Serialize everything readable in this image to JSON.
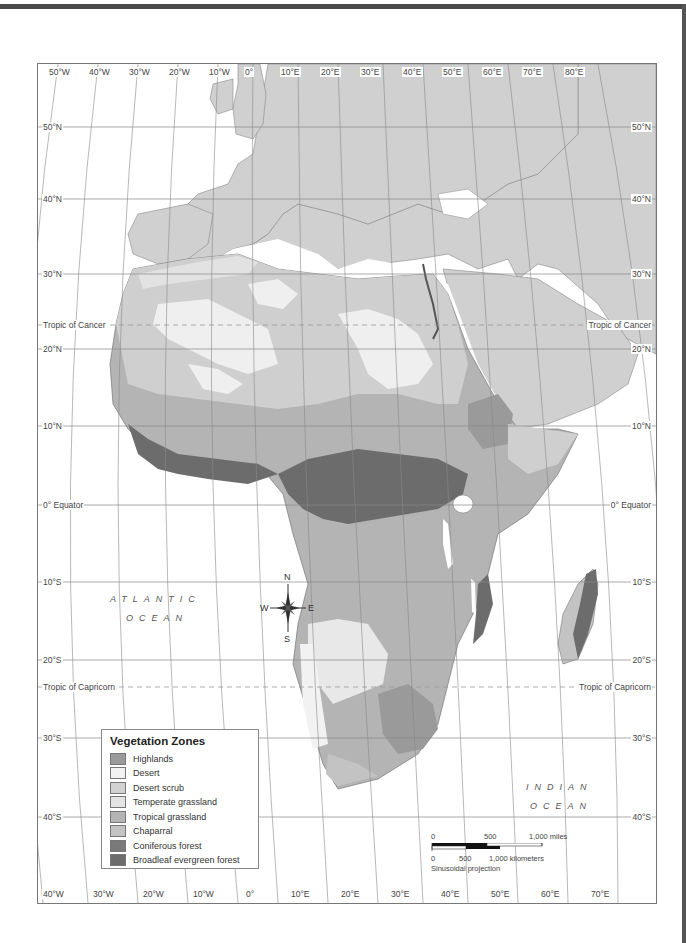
{
  "map": {
    "title": "Vegetation Zones of Africa",
    "top_longitudes": [
      "50°W",
      "40°W",
      "30°W",
      "20°W",
      "10°W",
      "0°",
      "10°E",
      "20°E",
      "30°E",
      "40°E",
      "50°E",
      "60°E",
      "70°E",
      "80°E"
    ],
    "bottom_longitudes": [
      "40°W",
      "30°W",
      "20°W",
      "10°W",
      "0°",
      "10°E",
      "20°E",
      "30°E",
      "40°E",
      "50°E",
      "60°E",
      "70°E"
    ],
    "latitudes_left": [
      "50°N",
      "40°N",
      "30°N",
      "Tropic of Cancer",
      "20°N",
      "10°N",
      "0° Equator",
      "10°S",
      "20°S",
      "Tropic of Capricorn",
      "30°S",
      "40°S"
    ],
    "latitudes_right": [
      "50°N",
      "40°N",
      "30°N",
      "Tropic of Cancer",
      "20°N",
      "10°N",
      "0° Equator",
      "10°S",
      "20°S",
      "Tropic of Capricorn",
      "30°S",
      "40°S"
    ],
    "oceans": {
      "atlantic_line1": "ATLANTIC",
      "atlantic_line2": "OCEAN",
      "indian_line1": "INDIAN",
      "indian_line2": "OCEAN"
    },
    "compass": {
      "n": "N",
      "s": "S",
      "e": "E",
      "w": "W"
    }
  },
  "legend": {
    "title": "Vegetation Zones",
    "items": [
      {
        "label": "Highlands",
        "color": "#9a9a9a"
      },
      {
        "label": "Desert",
        "color": "#f2f2f2"
      },
      {
        "label": "Desert scrub",
        "color": "#d2d2d2"
      },
      {
        "label": "Temperate grassland",
        "color": "#e4e4e4"
      },
      {
        "label": "Tropical grassland",
        "color": "#b4b4b4"
      },
      {
        "label": "Chaparral",
        "color": "#c3c3c3"
      },
      {
        "label": "Coniferous forest",
        "color": "#7a7a7a"
      },
      {
        "label": "Broadleaf evergreen forest",
        "color": "#6c6c6c"
      }
    ]
  },
  "scale_bar": {
    "miles_0": "0",
    "miles_500": "500",
    "miles_1000": "1,000 miles",
    "km_0": "0",
    "km_500": "500",
    "km_1000": "1,000 kilometers",
    "projection": "Sinusoidal projection"
  }
}
